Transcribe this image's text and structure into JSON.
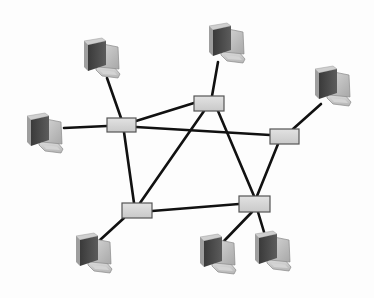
{
  "diagram": {
    "title": "",
    "type": "network-topology",
    "colors": {
      "background": "#fdfdfd",
      "link": "#111111",
      "switch_fill": "#d6d6d6",
      "switch_stroke": "#555555",
      "pc_front": "#bdbdbd",
      "pc_side": "#4a4a4a",
      "pc_base": "#c8c8c8"
    },
    "switches": [
      {
        "id": "S1",
        "x": 107,
        "y": 118,
        "w": 29,
        "h": 14
      },
      {
        "id": "S2",
        "x": 194,
        "y": 96,
        "w": 30,
        "h": 15
      },
      {
        "id": "S3",
        "x": 270,
        "y": 129,
        "w": 29,
        "h": 15
      },
      {
        "id": "S4",
        "x": 122,
        "y": 203,
        "w": 30,
        "h": 15
      },
      {
        "id": "S5",
        "x": 239,
        "y": 196,
        "w": 31,
        "h": 16
      }
    ],
    "computers": [
      {
        "id": "PC1",
        "x": 80,
        "y": 37,
        "attach": [
          107,
          78
        ]
      },
      {
        "id": "PC2",
        "x": 23,
        "y": 112,
        "attach": [
          64,
          128
        ]
      },
      {
        "id": "PC3",
        "x": 205,
        "y": 22,
        "attach": [
          218,
          62
        ]
      },
      {
        "id": "PC4",
        "x": 311,
        "y": 65,
        "attach": [
          321,
          104
        ]
      },
      {
        "id": "PC5",
        "x": 72,
        "y": 232,
        "attach": [
          100,
          240
        ]
      },
      {
        "id": "PC6",
        "x": 196,
        "y": 233,
        "attach": [
          224,
          241
        ]
      },
      {
        "id": "PC7",
        "x": 251,
        "y": 230,
        "attach": [
          264,
          232
        ]
      }
    ],
    "links": [
      {
        "from": [
          121,
          118
        ],
        "to": [
          107,
          78
        ]
      },
      {
        "from": [
          107,
          126
        ],
        "to": [
          64,
          128
        ]
      },
      {
        "from": [
          136,
          121
        ],
        "to": [
          194,
          103
        ]
      },
      {
        "from": [
          136,
          127
        ],
        "to": [
          270,
          135
        ]
      },
      {
        "from": [
          124,
          132
        ],
        "to": [
          134,
          203
        ]
      },
      {
        "from": [
          212,
          96
        ],
        "to": [
          218,
          62
        ]
      },
      {
        "from": [
          204,
          111
        ],
        "to": [
          140,
          203
        ]
      },
      {
        "from": [
          218,
          111
        ],
        "to": [
          254,
          196
        ]
      },
      {
        "from": [
          293,
          129
        ],
        "to": [
          321,
          104
        ]
      },
      {
        "from": [
          278,
          144
        ],
        "to": [
          257,
          196
        ]
      },
      {
        "from": [
          152,
          211
        ],
        "to": [
          239,
          204
        ]
      },
      {
        "from": [
          124,
          218
        ],
        "to": [
          100,
          240
        ]
      },
      {
        "from": [
          252,
          212
        ],
        "to": [
          224,
          241
        ]
      },
      {
        "from": [
          258,
          212
        ],
        "to": [
          264,
          232
        ]
      }
    ]
  }
}
